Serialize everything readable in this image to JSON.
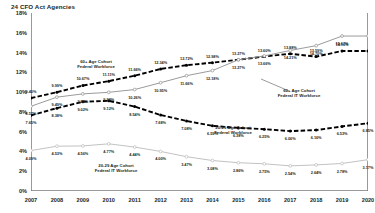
{
  "chart_data": {
    "type": "line",
    "title": "24 CFO Act Agencies",
    "xlabel": "",
    "ylabel": "",
    "ylim": [
      0,
      18
    ],
    "yticks": [
      "0%",
      "2%",
      "4%",
      "6%",
      "8%",
      "10%",
      "12%",
      "14%",
      "16%",
      "18%"
    ],
    "ytick_values": [
      0,
      2,
      4,
      6,
      8,
      10,
      12,
      14,
      16,
      18
    ],
    "grid": false,
    "legend": "annotations",
    "x": [
      2007,
      2008,
      2009,
      2010,
      2011,
      2012,
      2013,
      2014,
      2015,
      2016,
      2017,
      2018,
      2019,
      2020
    ],
    "categories": [
      "2007",
      "2008",
      "2009",
      "2010",
      "2011",
      "2012",
      "2013",
      "2014",
      "2015",
      "2016",
      "2017",
      "2018",
      "2019",
      "2020"
    ],
    "series": [
      {
        "name": "60+ Age Cohort Federal Workforce",
        "style": "dashed-black",
        "color": "#000000",
        "values": [
          9.4,
          9.99,
          10.67,
          11.11,
          11.66,
          12.34,
          12.72,
          12.98,
          13.27,
          13.6,
          13.88,
          13.59,
          14.16,
          14.16
        ],
        "labels": [
          "9.40%",
          "9.99%",
          "10.67%",
          "11.11%",
          "11.66%",
          "12.34%",
          "12.72%",
          "12.98%",
          "13.27%",
          "13.60%",
          "13.88%",
          "13.59%",
          "14.16%",
          ""
        ],
        "annotation": {
          "text_line1": "60+ Age Cohort",
          "text_line2": "Federal Workforce",
          "x_px": 96,
          "y_px": 64
        }
      },
      {
        "name": "60+ Age Cohort Federal IT Workforce",
        "style": "solid-gray",
        "color": "#9b9b9b",
        "values": [
          8.57,
          9.49,
          9.82,
          9.98,
          10.26,
          10.95,
          11.66,
          12.18,
          13.27,
          13.66,
          14.21,
          14.7,
          15.67,
          15.67
        ],
        "labels": [
          "8.57%",
          "9.49%",
          "9.82%",
          "9.98%",
          "10.26%",
          "10.95%",
          "11.66%",
          "12.18%",
          "13.27%",
          "13.66%",
          "14.21%",
          "14.70%",
          "15.67%",
          ""
        ],
        "annotation": {
          "text_line1": "60+ Age Cohort",
          "text_line2": "Federal IT Workforce",
          "x_px": 299,
          "y_px": 93
        }
      },
      {
        "name": "20-29 Age Cohort Federal Workforce",
        "style": "dashed-black",
        "color": "#000000",
        "values": [
          7.65,
          8.38,
          9.02,
          9.12,
          8.54,
          7.68,
          7.08,
          6.59,
          6.38,
          6.25,
          6.06,
          6.16,
          6.53,
          6.85
        ],
        "labels": [
          "7.65%",
          "8.38%",
          "9.02%",
          "9.12%",
          "8.54%",
          "7.68%",
          "7.08%",
          "6.59%",
          "6.38%",
          "6.25%",
          "6.06%",
          "6.16%",
          "6.53%",
          "6.85%"
        ],
        "annotation": {
          "text_line1": "20-29 Age Cohort",
          "text_line2": "Federal Workforce",
          "x_px": 233,
          "y_px": 130
        }
      },
      {
        "name": "20-29 Age Cohort Federal IT Workforce",
        "style": "solid-lightgray",
        "color": "#c2c2c2",
        "values": [
          4.09,
          4.53,
          4.56,
          4.77,
          4.44,
          4.0,
          3.47,
          3.08,
          2.86,
          2.75,
          2.54,
          2.64,
          2.78,
          3.17
        ],
        "labels": [
          "4.09%",
          "4.53%",
          "4.56%",
          "4.77%",
          "4.44%",
          "4.00%",
          "3.47%",
          "3.08%",
          "2.86%",
          "2.75%",
          "2.54%",
          "2.64%",
          "2.78%",
          "3.17%"
        ],
        "annotation": {
          "text_line1": "20-29 Age Cohort",
          "text_line2": "Federal IT Workforce",
          "x_px": 116,
          "y_px": 168
        }
      }
    ]
  }
}
